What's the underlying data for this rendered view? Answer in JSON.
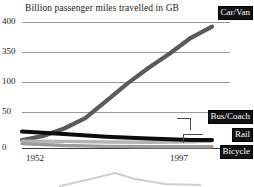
{
  "chart_data": {
    "type": "line",
    "title": "Billion passenger miles travelled in GB",
    "xlabel": "",
    "ylabel": "",
    "grid": true,
    "legend_position": "right-inline-callouts",
    "x": [
      1952,
      1997
    ],
    "xticks": [
      "1952",
      "1997"
    ],
    "yticks": [
      "400",
      "350",
      "100",
      "50",
      "0"
    ],
    "ylim": [
      0,
      400
    ],
    "series": [
      {
        "name": "Car/Van",
        "color": "#5a5a5a",
        "points": [
          {
            "x": 1952,
            "y": 25
          },
          {
            "x": 1957,
            "y": 38
          },
          {
            "x": 1962,
            "y": 62
          },
          {
            "x": 1967,
            "y": 95
          },
          {
            "x": 1972,
            "y": 150
          },
          {
            "x": 1977,
            "y": 205
          },
          {
            "x": 1982,
            "y": 255
          },
          {
            "x": 1987,
            "y": 300
          },
          {
            "x": 1992,
            "y": 350
          },
          {
            "x": 1997,
            "y": 385
          }
        ]
      },
      {
        "name": "Bus/Coach",
        "color": "#0d0d0d",
        "points": [
          {
            "x": 1952,
            "y": 52
          },
          {
            "x": 1962,
            "y": 44
          },
          {
            "x": 1972,
            "y": 36
          },
          {
            "x": 1982,
            "y": 30
          },
          {
            "x": 1992,
            "y": 25
          },
          {
            "x": 1997,
            "y": 25
          }
        ]
      },
      {
        "name": "Rail",
        "color": "#b4b4b4",
        "points": [
          {
            "x": 1952,
            "y": 22
          },
          {
            "x": 1962,
            "y": 21
          },
          {
            "x": 1972,
            "y": 19
          },
          {
            "x": 1982,
            "y": 18
          },
          {
            "x": 1992,
            "y": 20
          },
          {
            "x": 1997,
            "y": 22
          }
        ]
      },
      {
        "name": "Bicycle",
        "color": "#9c9c9c",
        "points": [
          {
            "x": 1952,
            "y": 14
          },
          {
            "x": 1962,
            "y": 8
          },
          {
            "x": 1972,
            "y": 5
          },
          {
            "x": 1982,
            "y": 4
          },
          {
            "x": 1992,
            "y": 4
          },
          {
            "x": 1997,
            "y": 4
          }
        ]
      }
    ]
  },
  "axes": {
    "y": {
      "t400": "400",
      "t350": "350",
      "t100": "100",
      "t50": "50",
      "t0": "0"
    },
    "x": {
      "start": "1952",
      "end": "1997"
    }
  },
  "legend": {
    "car": "Car/Van",
    "bus": "Bus/Coach",
    "rail": "Rail",
    "bicycle": "Bicycle"
  },
  "colors": {
    "car": "#5a5a5a",
    "bus": "#0d0d0d",
    "rail": "#b4b4b4",
    "bicycle": "#9c9c9c",
    "grid": "#9a9a9a",
    "axis": "#3a3a3a",
    "legend_bg": "#121212",
    "legend_fg": "#ffffff"
  }
}
